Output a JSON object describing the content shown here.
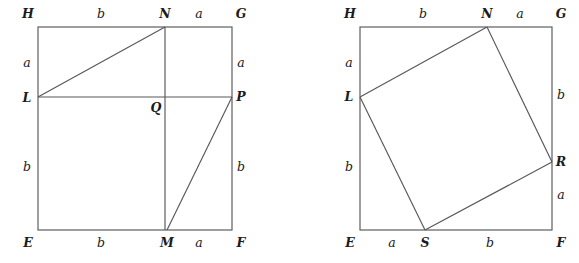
{
  "figure": {
    "stroke_color": "#58585a",
    "label_color": "#1b1b1b",
    "background_color": "#ffffff",
    "width": 579,
    "height": 263
  },
  "diagrams": [
    {
      "id": "left-diagram",
      "name": "square-EFGH-with-rectangles",
      "square": {
        "left": 38,
        "top": 27,
        "right": 232,
        "bottom": 230
      },
      "vertices": [
        {
          "key": "H",
          "text": "H",
          "x": 28,
          "y": 14,
          "name": "vertex-label-H"
        },
        {
          "key": "N",
          "text": "N",
          "x": 165,
          "y": 14,
          "name": "vertex-label-N"
        },
        {
          "key": "G",
          "text": "G",
          "x": 241,
          "y": 14,
          "name": "vertex-label-G"
        },
        {
          "key": "L",
          "text": "L",
          "x": 27,
          "y": 98,
          "name": "vertex-label-L"
        },
        {
          "key": "Q",
          "text": "Q",
          "x": 156,
          "y": 108,
          "name": "vertex-label-Q"
        },
        {
          "key": "P",
          "text": "P",
          "x": 241,
          "y": 97,
          "name": "vertex-label-P"
        },
        {
          "key": "E",
          "text": "E",
          "x": 28,
          "y": 243,
          "name": "vertex-label-E"
        },
        {
          "key": "M",
          "text": "M",
          "x": 167,
          "y": 243,
          "name": "vertex-label-M"
        },
        {
          "key": "F",
          "text": "F",
          "x": 241,
          "y": 243,
          "name": "vertex-label-F"
        }
      ],
      "segment_labels": [
        {
          "text": "b",
          "x": 101,
          "y": 14,
          "name": "segment-label-HN-b"
        },
        {
          "text": "a",
          "x": 199,
          "y": 14,
          "name": "segment-label-NG-a"
        },
        {
          "text": "a",
          "x": 27,
          "y": 63,
          "name": "segment-label-HL-a"
        },
        {
          "text": "a",
          "x": 241,
          "y": 63,
          "name": "segment-label-GP-a"
        },
        {
          "text": "b",
          "x": 27,
          "y": 167,
          "name": "segment-label-LE-b"
        },
        {
          "text": "b",
          "x": 241,
          "y": 167,
          "name": "segment-label-PF-b"
        },
        {
          "text": "b",
          "x": 101,
          "y": 243,
          "name": "segment-label-EM-b"
        },
        {
          "text": "a",
          "x": 199,
          "y": 243,
          "name": "segment-label-MF-a"
        }
      ],
      "interior_paths": [
        {
          "name": "segment-LP-horizontal",
          "d": "M 38 97 L 232 97"
        },
        {
          "name": "segment-NM-vertical",
          "d": "M 165 27 L 165 230"
        },
        {
          "name": "segment-LN-hypotenuse",
          "d": "M 38 97 L 165 27"
        },
        {
          "name": "segment-MP-hypotenuse",
          "d": "M 167 230 L 232 97"
        }
      ]
    },
    {
      "id": "right-diagram",
      "name": "square-EFGH-with-inscribed-tilted-square",
      "square": {
        "left": 360,
        "top": 27,
        "right": 552,
        "bottom": 230
      },
      "vertices": [
        {
          "key": "H",
          "text": "H",
          "x": 350,
          "y": 14,
          "name": "vertex-label-H"
        },
        {
          "key": "N",
          "text": "N",
          "x": 487,
          "y": 14,
          "name": "vertex-label-N"
        },
        {
          "key": "G",
          "text": "G",
          "x": 561,
          "y": 14,
          "name": "vertex-label-G"
        },
        {
          "key": "L",
          "text": "L",
          "x": 349,
          "y": 97,
          "name": "vertex-label-L"
        },
        {
          "key": "R",
          "text": "R",
          "x": 561,
          "y": 162,
          "name": "vertex-label-R"
        },
        {
          "key": "E",
          "text": "E",
          "x": 350,
          "y": 243,
          "name": "vertex-label-E"
        },
        {
          "key": "S",
          "text": "S",
          "x": 425,
          "y": 243,
          "name": "vertex-label-S"
        },
        {
          "key": "F",
          "text": "F",
          "x": 561,
          "y": 243,
          "name": "vertex-label-F"
        }
      ],
      "segment_labels": [
        {
          "text": "b",
          "x": 423,
          "y": 14,
          "name": "segment-label-HN-b"
        },
        {
          "text": "a",
          "x": 520,
          "y": 14,
          "name": "segment-label-NG-a"
        },
        {
          "text": "a",
          "x": 349,
          "y": 63,
          "name": "segment-label-HL-a"
        },
        {
          "text": "b",
          "x": 561,
          "y": 95,
          "name": "segment-label-GR-b"
        },
        {
          "text": "b",
          "x": 349,
          "y": 167,
          "name": "segment-label-LE-b"
        },
        {
          "text": "a",
          "x": 561,
          "y": 195,
          "name": "segment-label-RF-a"
        },
        {
          "text": "a",
          "x": 392,
          "y": 243,
          "name": "segment-label-ES-a"
        },
        {
          "text": "b",
          "x": 490,
          "y": 243,
          "name": "segment-label-SF-b"
        }
      ],
      "interior_paths": [
        {
          "name": "segment-LN-tilted-square-side",
          "d": "M 360 97 L 487 27"
        },
        {
          "name": "segment-NR-tilted-square-side",
          "d": "M 487 27 L 552 162"
        },
        {
          "name": "segment-RS-tilted-square-side",
          "d": "M 552 162 L 425 230"
        },
        {
          "name": "segment-SL-tilted-square-side",
          "d": "M 425 230 L 360 97"
        }
      ]
    }
  ]
}
